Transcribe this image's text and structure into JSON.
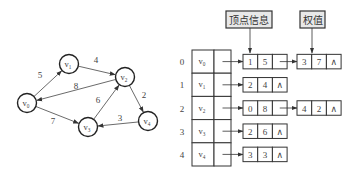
{
  "graph": {
    "vertices": [
      {
        "id": "v0",
        "base": "v",
        "sub": "0",
        "x": 27,
        "y": 103
      },
      {
        "id": "v1",
        "base": "v",
        "sub": "1",
        "x": 69,
        "y": 64
      },
      {
        "id": "v2",
        "base": "v",
        "sub": "2",
        "x": 125,
        "y": 77
      },
      {
        "id": "v3",
        "base": "v",
        "sub": "3",
        "x": 88,
        "y": 127
      },
      {
        "id": "v4",
        "base": "v",
        "sub": "4",
        "x": 148,
        "y": 121
      }
    ],
    "edges": [
      {
        "from": 0,
        "to": 1,
        "weight": "5",
        "lx": 40,
        "ly": 78
      },
      {
        "from": 1,
        "to": 2,
        "weight": "4",
        "lx": 96,
        "ly": 63
      },
      {
        "from": 2,
        "to": 0,
        "weight": "8",
        "lx": 76,
        "ly": 89
      },
      {
        "from": 0,
        "to": 3,
        "weight": "7",
        "lx": 53,
        "ly": 124
      },
      {
        "from": 3,
        "to": 2,
        "weight": "6",
        "lx": 98,
        "ly": 103
      },
      {
        "from": 2,
        "to": 4,
        "weight": "2",
        "lx": 144,
        "ly": 98
      },
      {
        "from": 4,
        "to": 3,
        "weight": "3",
        "lx": 120,
        "ly": 121
      }
    ]
  },
  "adjacency_list": {
    "callouts": {
      "vertex_info": "顶点信息",
      "weight": "权值"
    },
    "rows": [
      {
        "index": "0",
        "vertex": "v",
        "sub": "0",
        "edges": [
          [
            "1",
            "5"
          ],
          [
            "3",
            "7"
          ]
        ]
      },
      {
        "index": "1",
        "vertex": "v",
        "sub": "1",
        "edges": [
          [
            "2",
            "4"
          ]
        ]
      },
      {
        "index": "2",
        "vertex": "v",
        "sub": "2",
        "edges": [
          [
            "0",
            "8"
          ],
          [
            "4",
            "2"
          ]
        ]
      },
      {
        "index": "3",
        "vertex": "v",
        "sub": "3",
        "edges": [
          [
            "2",
            "6"
          ]
        ]
      },
      {
        "index": "4",
        "vertex": "v",
        "sub": "4",
        "edges": [
          [
            "3",
            "3"
          ]
        ]
      }
    ],
    "null_symbol": "∧"
  }
}
